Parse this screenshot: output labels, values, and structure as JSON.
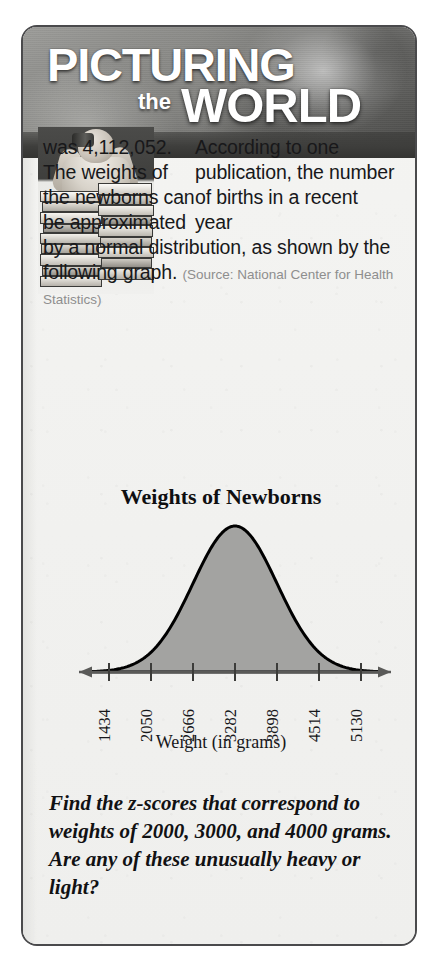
{
  "banner": {
    "word1": "PICTURING",
    "word2": "the",
    "word3": "WORLD",
    "background_color": "#6f6f6d",
    "text_color": "#ffffff"
  },
  "photo": {
    "alt_name": "person-with-binoculars-and-book-stacks-photo"
  },
  "body": {
    "lead_paragraph": "According to one publication, the number of births in a recent year",
    "continuation": "was 4,112,052. The weights of the newborns can be approximated by a normal distribution, as shown by the following graph.",
    "source": "(Source: National Center for Health Statistics)",
    "birth_count": "4,112,052"
  },
  "question": {
    "text": "Find the z-scores that correspond to weights of 2000, 3000, and 4000 grams. Are any of these unusually heavy or light?"
  },
  "chart_data": {
    "type": "area",
    "title": "Weights of Newborns",
    "xlabel": "Weight (in grams)",
    "ylabel": "",
    "tick_labels": [
      "1434",
      "2050",
      "2666",
      "3282",
      "3898",
      "4514",
      "5130"
    ],
    "tick_values": [
      1434,
      2050,
      2666,
      3282,
      3898,
      4514,
      5130
    ],
    "mean": 3282,
    "std_dev": 616,
    "xlim": [
      1126,
      5438
    ],
    "grid": false,
    "legend": "none",
    "curve_fill_color": "#a3a3a1",
    "curve_line_color": "#000000",
    "axis_arrows": "both",
    "tick_label_rotation": -90,
    "distribution": "normal",
    "x": [
      1126,
      1434,
      1742,
      2050,
      2358,
      2666,
      2974,
      3282,
      3590,
      3898,
      4206,
      4514,
      4822,
      5130,
      5438
    ],
    "y": [
      0.011,
      0.044,
      0.135,
      0.324,
      0.607,
      0.882,
      0.969,
      1.0,
      0.969,
      0.882,
      0.607,
      0.324,
      0.135,
      0.044,
      0.011
    ]
  },
  "colors": {
    "page_background": "#ffffff",
    "box_background": "#f3f3f1",
    "box_border": "#4a4a4c",
    "body_text": "#18181a",
    "source_text": "#8e8e8e"
  }
}
